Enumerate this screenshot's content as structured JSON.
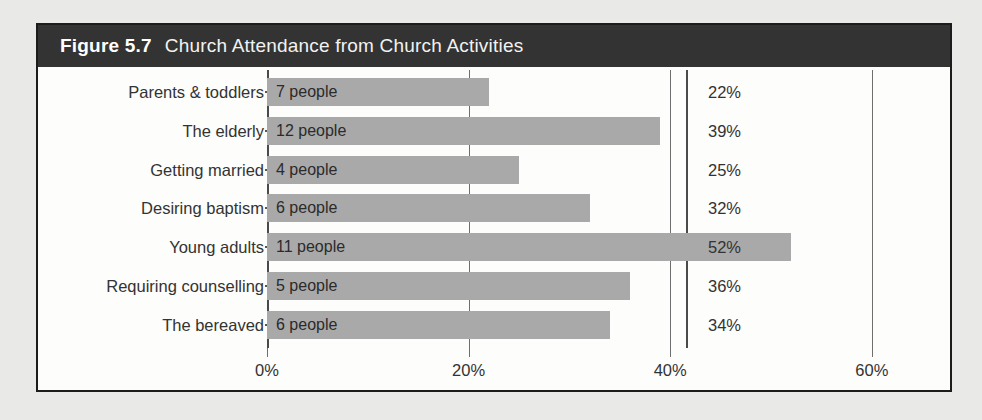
{
  "figure": {
    "number": "Figure 5.7",
    "caption": "Church Attendance from Church Activities"
  },
  "chart_data": {
    "type": "bar",
    "orientation": "horizontal",
    "title": "Figure 5.7 Church Attendance from Church Activities",
    "xlabel": "",
    "ylabel": "",
    "xlim": [
      0,
      60
    ],
    "xticks": [
      "0%",
      "20%",
      "40%",
      "60%"
    ],
    "xtick_values": [
      0,
      20,
      40,
      60
    ],
    "grid": true,
    "legend": "none",
    "categories": [
      "Parents & toddlers",
      "The elderly",
      "Getting married",
      "Desiring baptism",
      "Young adults",
      "Requiring counselling",
      "The bereaved"
    ],
    "values": [
      22,
      39,
      25,
      32,
      52,
      36,
      34
    ],
    "bar_labels": [
      "7 people",
      "12 people",
      "4 people",
      "6 people",
      "11 people",
      "5 people",
      "6 people"
    ],
    "people_counts": [
      7,
      12,
      4,
      6,
      11,
      5,
      6
    ],
    "value_labels": [
      "22%",
      "39%",
      "25%",
      "32%",
      "52%",
      "36%",
      "34%"
    ],
    "colors": {
      "bar": "#a9a9a9",
      "header_background": "#333333",
      "header_text": "#ffffff",
      "frame": "#1c1c1c",
      "plot_background": "#fdfdfb",
      "page_background": "#e9e9e7",
      "axis": "#4a4a4a",
      "gridline": "#6e6e6e",
      "text": "#333333"
    }
  }
}
